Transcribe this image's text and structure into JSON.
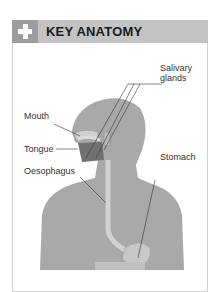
{
  "header": {
    "icon": "plus-icon",
    "title": "KEY ANATOMY"
  },
  "labels": {
    "salivary_glands_line1": "Salivary",
    "salivary_glands_line2": "glands",
    "mouth": "Mouth",
    "tongue": "Tongue",
    "oesophagus": "Oesophagus",
    "stomach": "Stomach"
  },
  "colors": {
    "header_bg": "#c3c3c3",
    "icon_box": "#9d9d9d",
    "body_fill": "#a9a9a9",
    "organ_fill": "#c8c8c8"
  }
}
